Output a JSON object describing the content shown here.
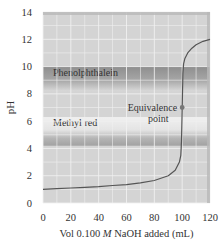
{
  "chart_data": {
    "type": "line",
    "title": "",
    "xlabel": "Vol 0.100 M NaOH added (mL)",
    "xlabel_parts": [
      "Vol 0.100 ",
      "M",
      " NaOH added (mL)"
    ],
    "ylabel": "pH",
    "xlim": [
      0,
      120
    ],
    "ylim": [
      0,
      14
    ],
    "x_ticks": [
      0,
      20,
      40,
      60,
      80,
      100,
      120
    ],
    "y_ticks": [
      0,
      2,
      4,
      6,
      8,
      10,
      12,
      14
    ],
    "grid": true,
    "series": [
      {
        "name": "Titration curve",
        "x": [
          0,
          10,
          20,
          30,
          40,
          50,
          60,
          70,
          80,
          90,
          95,
          98,
          99,
          99.5,
          100,
          100.5,
          101,
          102,
          104,
          107,
          110,
          115,
          120
        ],
        "y": [
          1.0,
          1.05,
          1.1,
          1.15,
          1.2,
          1.28,
          1.35,
          1.48,
          1.65,
          2.0,
          2.4,
          3.0,
          3.5,
          4.5,
          7.0,
          9.5,
          10.2,
          10.6,
          11.0,
          11.35,
          11.6,
          11.85,
          12.0
        ]
      }
    ],
    "bands": [
      {
        "label": "Phenolphthalein",
        "ymin": 8.2,
        "ymax": 10.0
      },
      {
        "label": "Methyl red",
        "ymin": 4.2,
        "ymax": 6.3
      }
    ],
    "annotations": [
      {
        "text_lines": [
          "Equivalence",
          "point"
        ],
        "x": 100,
        "y": 7.0,
        "marker": "dot"
      }
    ]
  },
  "colors": {
    "plot_bg": "#d4d4d4",
    "grid": "#f2f2f2",
    "curve": "#555555",
    "band_dark": "#9a9a9a",
    "band_light": "#ececec",
    "point": "#777777",
    "frame": "#b8b8b8"
  }
}
